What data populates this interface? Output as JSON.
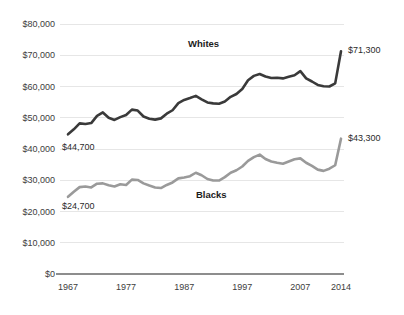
{
  "chart_data": {
    "type": "line",
    "title": "",
    "subtitle": "",
    "xlabel": "",
    "ylabel": "",
    "grid": true,
    "legend_position": "inline-annotation",
    "xlim": [
      1967,
      2014
    ],
    "ylim": [
      0,
      80000
    ],
    "y_ticks": [
      0,
      10000,
      20000,
      30000,
      40000,
      50000,
      60000,
      70000,
      80000
    ],
    "y_tick_labels": [
      "$0",
      "$10,000",
      "$20,000",
      "$30,000",
      "$40,000",
      "$50,000",
      "$60,000",
      "$70,000",
      "$80,000"
    ],
    "x_ticks": [
      1967,
      1977,
      1987,
      1997,
      2007,
      2014
    ],
    "x_tick_labels": [
      "1967",
      "1977",
      "1987",
      "1997",
      "2007",
      "2014"
    ],
    "annotations": [
      {
        "name": "whites-start-value",
        "text": "$44,700",
        "x": 1967,
        "y": 44700
      },
      {
        "name": "whites-end-value",
        "text": "$71,300",
        "x": 2014,
        "y": 71300
      },
      {
        "name": "blacks-start-value",
        "text": "$24,700",
        "x": 1967,
        "y": 24700
      },
      {
        "name": "blacks-end-value",
        "text": "$43,300",
        "x": 2014,
        "y": 43300
      }
    ],
    "x": [
      1967,
      1968,
      1969,
      1970,
      1971,
      1972,
      1973,
      1974,
      1975,
      1976,
      1977,
      1978,
      1979,
      1980,
      1981,
      1982,
      1983,
      1984,
      1985,
      1986,
      1987,
      1988,
      1989,
      1990,
      1991,
      1992,
      1993,
      1994,
      1995,
      1996,
      1997,
      1998,
      1999,
      2000,
      2001,
      2002,
      2003,
      2004,
      2005,
      2006,
      2007,
      2008,
      2009,
      2010,
      2011,
      2012,
      2013,
      2014
    ],
    "series": [
      {
        "name": "Whites",
        "color": "#3a3a3a",
        "label_text": "Whites",
        "values": [
          44700,
          46300,
          48200,
          48000,
          48300,
          50600,
          51700,
          50000,
          49300,
          50200,
          50900,
          52600,
          52300,
          50400,
          49700,
          49400,
          49800,
          51300,
          52400,
          54700,
          55700,
          56300,
          57000,
          55900,
          54900,
          54600,
          54500,
          55200,
          56700,
          57600,
          59200,
          62000,
          63400,
          64000,
          63200,
          62700,
          62800,
          62600,
          63100,
          63600,
          64900,
          62600,
          61600,
          60500,
          60100,
          60000,
          61000,
          71300
        ]
      },
      {
        "name": "Blacks",
        "color": "#9a9a9a",
        "label_text": "Blacks",
        "values": [
          24700,
          26300,
          27800,
          28000,
          27700,
          28900,
          29000,
          28400,
          28000,
          28700,
          28500,
          30200,
          30100,
          29000,
          28300,
          27700,
          27500,
          28500,
          29300,
          30600,
          30900,
          31300,
          32400,
          31600,
          30400,
          29900,
          29900,
          31000,
          32400,
          33200,
          34400,
          36200,
          37400,
          38200,
          36800,
          36000,
          35600,
          35300,
          36000,
          36700,
          37000,
          35600,
          34600,
          33400,
          33000,
          33700,
          34800,
          43300
        ]
      }
    ]
  },
  "axis": {
    "y_labels": [
      "$80,000",
      "$70,000",
      "$60,000",
      "$50,000",
      "$40,000",
      "$30,000",
      "$20,000",
      "$10,000",
      "$0"
    ],
    "x_labels": [
      "1967",
      "1977",
      "1987",
      "1997",
      "2007",
      "2014"
    ]
  },
  "labels": {
    "whites": "Whites",
    "blacks": "Blacks",
    "whites_start": "$44,700",
    "whites_end": "$71,300",
    "blacks_start": "$24,700",
    "blacks_end": "$43,300"
  },
  "colors": {
    "whites_line": "#3a3a3a",
    "blacks_line": "#9a9a9a",
    "gridline": "#e6e6e6",
    "axis": "#8d8d8d",
    "text": "#3d3d3d"
  }
}
